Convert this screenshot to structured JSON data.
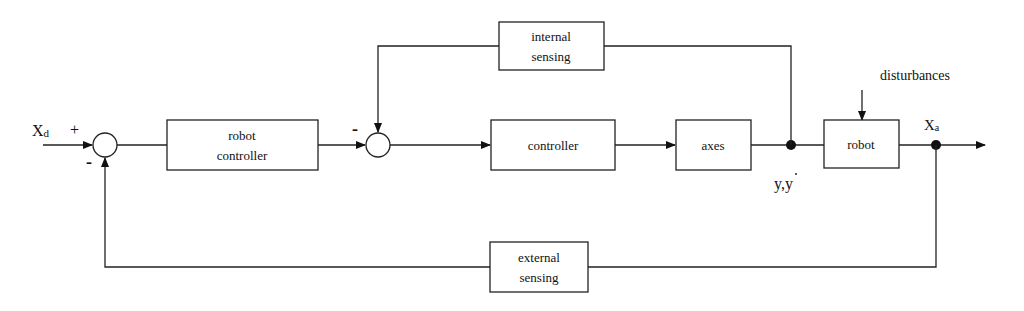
{
  "diagram": {
    "type": "block-diagram",
    "input": {
      "label": "X",
      "subscript": "d"
    },
    "output": {
      "label": "X",
      "subscript": "a"
    },
    "intermediate_signal": {
      "label": "y,y",
      "dot_over_second": true
    },
    "disturbance": {
      "label": "disturbances"
    },
    "summing_junctions": [
      {
        "id": "sum1",
        "plus_sign": "+",
        "minus_sign": "-"
      },
      {
        "id": "sum2",
        "minus_sign": "-"
      }
    ],
    "blocks": {
      "robot_controller": {
        "line1": "robot",
        "line2": "controller"
      },
      "controller": {
        "label": "controller"
      },
      "axes": {
        "label": "axes"
      },
      "robot": {
        "label": "robot"
      },
      "internal_sensing": {
        "line1": "internal",
        "line2": "sensing"
      },
      "external_sensing": {
        "line1": "external",
        "line2": "sensing"
      }
    },
    "connections": [
      {
        "from": "Xd",
        "to": "sum1",
        "sign": "+"
      },
      {
        "from": "sum1",
        "to": "robot_controller"
      },
      {
        "from": "robot_controller",
        "to": "sum2"
      },
      {
        "from": "sum2",
        "to": "controller"
      },
      {
        "from": "controller",
        "to": "axes"
      },
      {
        "from": "axes",
        "to": "robot",
        "signal": "y,y-dot"
      },
      {
        "from": "y,y-dot",
        "to": "internal_sensing"
      },
      {
        "from": "internal_sensing",
        "to": "sum2",
        "sign": "-"
      },
      {
        "from": "disturbances",
        "to": "robot"
      },
      {
        "from": "robot",
        "to": "Xa"
      },
      {
        "from": "Xa",
        "to": "external_sensing"
      },
      {
        "from": "external_sensing",
        "to": "sum1",
        "sign": "-"
      }
    ]
  }
}
